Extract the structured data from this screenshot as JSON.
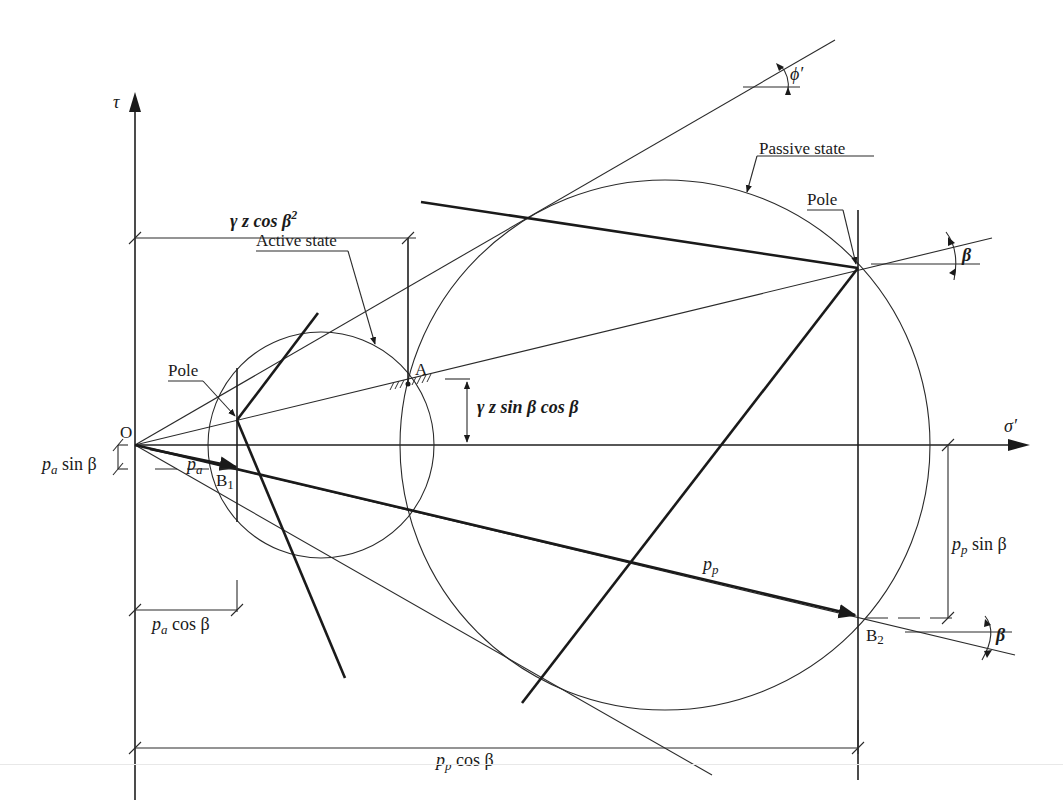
{
  "figure": {
    "type": "mohr-circle-diagram",
    "colors": {
      "ink": "#1a1a1a",
      "background": "#ffffff"
    }
  },
  "axes": {
    "tau_label": "τ",
    "sigma_label": "σ′",
    "origin_label": "O",
    "origin": [
      135,
      445
    ],
    "tau_axis_top": [
      135,
      95
    ],
    "sigma_axis_end": [
      1028,
      445
    ]
  },
  "circles": {
    "active": {
      "label": "Active state",
      "center": [
        321,
        445
      ],
      "radius": 113
    },
    "passive": {
      "label": "Passive state",
      "center": [
        665,
        445
      ],
      "radius": 265
    }
  },
  "points": {
    "A": {
      "label": "A",
      "xy": [
        408,
        384
      ]
    },
    "B1": {
      "label": "B",
      "sub": "1",
      "xy": [
        237,
        467
      ]
    },
    "B2": {
      "label": "B",
      "sub": "2",
      "xy": [
        858,
        616
      ]
    },
    "active_pole": {
      "label": "Pole",
      "xy": [
        237,
        420
      ]
    },
    "passive_pole": {
      "label": "Pole",
      "xy": [
        858,
        268
      ]
    }
  },
  "angles": {
    "phi": "ϕ′",
    "beta_upper": "β",
    "beta_lower": "β"
  },
  "dimensions": {
    "gz_cos2": {
      "text": "γ z  cos β",
      "sup": "2"
    },
    "gz_sin_cos": {
      "text": "γ z  sin  β cos β"
    },
    "pa_sin": {
      "p": "p",
      "sub": "a",
      "rest": " sin  β"
    },
    "pa": {
      "p": "p",
      "sub": "a"
    },
    "pa_cos": {
      "p": "p",
      "sub": "a",
      "rest": " cos β"
    },
    "pp": {
      "p": "p",
      "sub": "p"
    },
    "pp_sin": {
      "p": "p",
      "sub": "p",
      "rest": "  sin  β"
    },
    "pp_cos": {
      "p": "p",
      "sub": "p",
      "rest": " cos β"
    }
  }
}
